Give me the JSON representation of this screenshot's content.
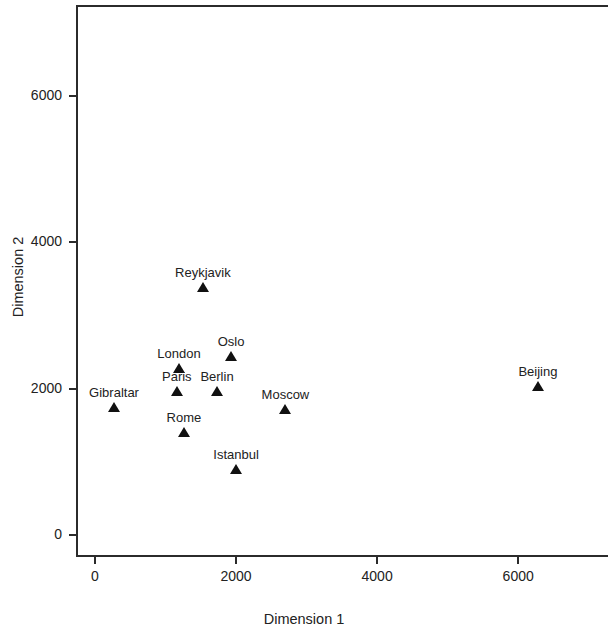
{
  "chart_data": {
    "type": "scatter",
    "title": "",
    "xlabel": "Dimension 1",
    "ylabel": "Dimension 2",
    "xlim": [
      -290,
      7260
    ],
    "ylim": [
      -310,
      7550
    ],
    "xticks": [
      0,
      2000,
      4000,
      6000
    ],
    "xticklabels": [
      "0",
      "2000",
      "4000",
      "6000"
    ],
    "yticks": [
      0,
      2000,
      4000,
      6000
    ],
    "yticklabels": [
      "0",
      "2000",
      "4000",
      "6000"
    ],
    "grid": false,
    "legend": false,
    "marker": "triangle-up",
    "marker_color": "#111111",
    "points": [
      {
        "label": "Reykjavik",
        "x": 1530,
        "y": 3390,
        "label_pos": "above"
      },
      {
        "label": "Oslo",
        "x": 1930,
        "y": 2450,
        "label_pos": "above"
      },
      {
        "label": "London",
        "x": 1190,
        "y": 2280,
        "label_pos": "above"
      },
      {
        "label": "Paris",
        "x": 1160,
        "y": 1970,
        "label_pos": "above"
      },
      {
        "label": "Berlin",
        "x": 1730,
        "y": 1970,
        "label_pos": "above"
      },
      {
        "label": "Gibraltar",
        "x": 270,
        "y": 1750,
        "label_pos": "above"
      },
      {
        "label": "Moscow",
        "x": 2700,
        "y": 1720,
        "label_pos": "above"
      },
      {
        "label": "Rome",
        "x": 1260,
        "y": 1410,
        "label_pos": "above"
      },
      {
        "label": "Istanbul",
        "x": 2000,
        "y": 900,
        "label_pos": "above"
      },
      {
        "label": "Beijing",
        "x": 6280,
        "y": 2040,
        "label_pos": "above"
      }
    ]
  }
}
